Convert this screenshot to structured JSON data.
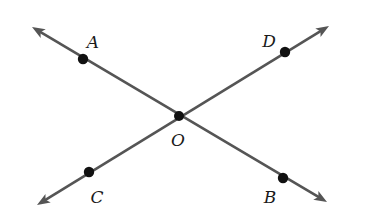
{
  "diagram": {
    "type": "intersecting-lines",
    "colors": {
      "line": "#555555",
      "point": "#111111",
      "label": "#1a1a1a",
      "background": "#ffffff"
    },
    "intersection": {
      "name": "O",
      "label": "O",
      "x": 179,
      "y": 116
    },
    "lines": [
      {
        "name": "line-AB",
        "from": {
          "x": 32,
          "y": 27
        },
        "to": {
          "x": 327,
          "y": 202
        }
      },
      {
        "name": "line-CD",
        "from": {
          "x": 37,
          "y": 205
        },
        "to": {
          "x": 329,
          "y": 26
        }
      }
    ],
    "points": [
      {
        "name": "A",
        "label": "A",
        "x": 83,
        "y": 59,
        "lx": 93,
        "ly": 48
      },
      {
        "name": "B",
        "label": "B",
        "x": 283,
        "y": 178,
        "lx": 270,
        "ly": 203
      },
      {
        "name": "C",
        "label": "C",
        "x": 89,
        "y": 172,
        "lx": 97,
        "ly": 203
      },
      {
        "name": "D",
        "label": "D",
        "x": 285,
        "y": 52,
        "lx": 269,
        "ly": 47
      },
      {
        "name": "O",
        "label": "O",
        "x": 179,
        "y": 116,
        "lx": 178,
        "ly": 146
      }
    ]
  }
}
